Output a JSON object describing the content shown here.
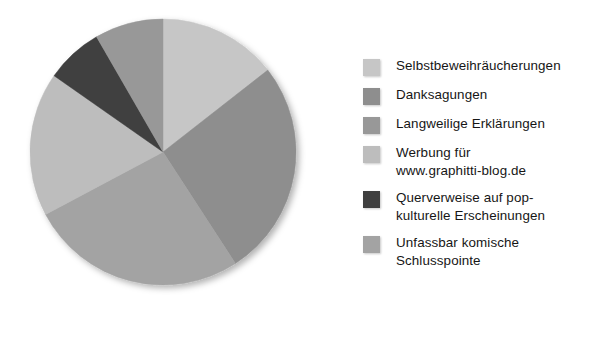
{
  "chart_data": {
    "type": "pie",
    "title": "",
    "subtitle": "",
    "xlabel": "",
    "ylabel": "",
    "grid": false,
    "legend_position": "right",
    "start_angle_deg": 0,
    "direction": "clockwise",
    "categories": [
      "Selbstbeweihräucherungen",
      "Danksagungen",
      "Langweilige Erklärungen",
      "Werbung für\nwww.graphitti-blog.de",
      "Querverweise auf pop-\nkulturelle Erscheinungen",
      "Unfassbar komische\nSchlusspointe"
    ],
    "values": [
      14.5,
      26.5,
      8.0,
      17.5,
      7.0,
      26.5
    ],
    "slice_angles_deg": [
      52,
      95,
      30,
      63,
      25,
      95
    ],
    "colors": [
      "#c6c6c6",
      "#8e8e8e",
      "#989898",
      "#bdbdbd",
      "#3f3f3f",
      "#a3a3a3"
    ],
    "annotations": []
  },
  "legend": {
    "items": [
      {
        "label": "Selbstbeweihräucherungen",
        "color": "#c6c6c6"
      },
      {
        "label": "Danksagungen",
        "color": "#8e8e8e"
      },
      {
        "label": "Langweilige Erklärungen",
        "color": "#989898"
      },
      {
        "label": "Werbung für\nwww.graphitti-blog.de",
        "color": "#bdbdbd"
      },
      {
        "label": "Querverweise auf pop-\nkulturelle Erscheinungen",
        "color": "#3f3f3f"
      },
      {
        "label": "Unfassbar komische\nSchlusspointe",
        "color": "#a3a3a3"
      }
    ]
  },
  "pie": {
    "center_x": 163,
    "center_y": 152,
    "radius": 133,
    "slices": [
      {
        "name": "Selbstbeweihräucherungen",
        "start_deg": 0,
        "end_deg": 52,
        "color": "#c6c6c6"
      },
      {
        "name": "Danksagungen",
        "start_deg": 52,
        "end_deg": 147,
        "color": "#8e8e8e"
      },
      {
        "name": "Unfassbar komische Schlusspointe",
        "start_deg": 147,
        "end_deg": 242,
        "color": "#a3a3a3"
      },
      {
        "name": "Werbung für www.graphitti-blog.de",
        "start_deg": 242,
        "end_deg": 305,
        "color": "#bdbdbd"
      },
      {
        "name": "Querverweise auf pop-kulturelle Erscheinungen",
        "start_deg": 305,
        "end_deg": 330,
        "color": "#3f3f3f"
      },
      {
        "name": "Langweilige Erklärungen",
        "start_deg": 330,
        "end_deg": 360,
        "color": "#989898"
      }
    ]
  }
}
